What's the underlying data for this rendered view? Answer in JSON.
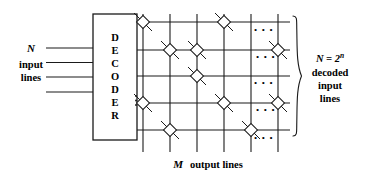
{
  "figure": {
    "type": "logic-diagram",
    "title_visible": false,
    "block": {
      "label": "DECODER",
      "letters": [
        "D",
        "E",
        "C",
        "O",
        "D",
        "E",
        "R"
      ]
    },
    "left_label": {
      "line1": "N",
      "line2": "input",
      "line3": "lines",
      "italic_first": true
    },
    "right_label": {
      "line1": "N = 2",
      "line1_sup": "n",
      "line2": "decoded",
      "line3": "input",
      "line4": "lines"
    },
    "bottom_label": {
      "symbol": "M",
      "text": "output lines"
    },
    "input_lines_count": 4,
    "output_rows_count": 5,
    "output_cols_count": 6,
    "ellipsis": "• • •",
    "vertical_ellipsis": "⋮",
    "colors": {
      "stroke": "#1a1a1a",
      "background": "#ffffff",
      "text": "#000000"
    }
  }
}
